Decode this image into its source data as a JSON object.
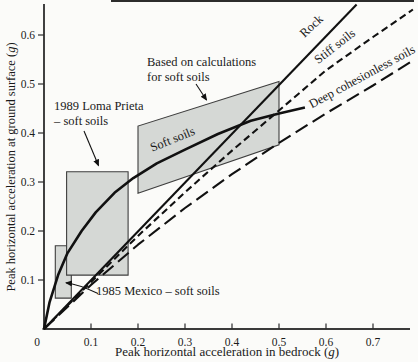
{
  "figure": {
    "background": "#fbfbf9",
    "ink": "#111111",
    "box_fill": "#d5d8d5",
    "box_stroke": "#3e3e3e"
  },
  "axes": {
    "xlabel_pre": "Peak horizontal acceleration in bedrock (",
    "xlabel_g": "g",
    "xlabel_post": ")",
    "ylabel_pre": "Peak horizontal acceleration at ground surface (",
    "ylabel_g": "g",
    "ylabel_post": ")"
  },
  "annotations": {
    "rock": "Rock",
    "stiff": "Stiff soils",
    "deep": "Deep cohesionless soils",
    "soft": "Soft soils",
    "calc_line1": "Based on calculations",
    "calc_line2": "for soft soils",
    "loma_line1": "1989 Loma Prieta",
    "loma_line2": "– soft soils",
    "mexico": "1985 Mexico – soft soils"
  },
  "chart_data": {
    "type": "line",
    "title": "",
    "xlabel": "Peak horizontal acceleration in bedrock (g)",
    "ylabel": "Peak horizontal acceleration at ground surface (g)",
    "xlim": [
      0,
      0.78
    ],
    "ylim": [
      0,
      0.665
    ],
    "x_ticks": [
      0,
      0.1,
      0.2,
      0.3,
      0.4,
      0.5,
      0.6,
      0.7
    ],
    "y_ticks": [
      0.1,
      0.2,
      0.3,
      0.4,
      0.5,
      0.6
    ],
    "grid": false,
    "legend_position": "labels-on-lines",
    "series": [
      {
        "name": "Rock",
        "style": "solid",
        "width": 2.1,
        "dash": "",
        "points": [
          [
            0,
            0
          ],
          [
            0.665,
            0.662
          ]
        ]
      },
      {
        "name": "Stiff soils",
        "style": "dashed",
        "width": 2.1,
        "dash": "7,4",
        "points": [
          [
            0,
            0
          ],
          [
            0.1,
            0.096
          ],
          [
            0.2,
            0.19
          ],
          [
            0.3,
            0.279
          ],
          [
            0.4,
            0.364
          ],
          [
            0.5,
            0.446
          ],
          [
            0.6,
            0.528
          ],
          [
            0.7,
            0.596
          ],
          [
            0.785,
            0.652
          ]
        ]
      },
      {
        "name": "Deep cohesionless soils",
        "style": "dashed",
        "width": 2.1,
        "dash": "14,6",
        "points": [
          [
            0,
            0
          ],
          [
            0.1,
            0.09
          ],
          [
            0.2,
            0.172
          ],
          [
            0.3,
            0.247
          ],
          [
            0.4,
            0.316
          ],
          [
            0.5,
            0.38
          ],
          [
            0.6,
            0.44
          ],
          [
            0.7,
            0.497
          ],
          [
            0.785,
            0.548
          ]
        ]
      },
      {
        "name": "Soft soils",
        "style": "solid",
        "width": 2.6,
        "dash": "",
        "points": [
          [
            0,
            0
          ],
          [
            0.012,
            0.055
          ],
          [
            0.03,
            0.11
          ],
          [
            0.05,
            0.155
          ],
          [
            0.08,
            0.2
          ],
          [
            0.11,
            0.238
          ],
          [
            0.15,
            0.278
          ],
          [
            0.19,
            0.308
          ],
          [
            0.24,
            0.338
          ],
          [
            0.3,
            0.366
          ],
          [
            0.37,
            0.398
          ],
          [
            0.44,
            0.425
          ],
          [
            0.5,
            0.44
          ],
          [
            0.555,
            0.452
          ]
        ]
      }
    ],
    "regions": [
      {
        "name": "1985 Mexico – soft soils box",
        "points": [
          [
            0.024,
            0.063
          ],
          [
            0.058,
            0.063
          ],
          [
            0.058,
            0.17
          ],
          [
            0.024,
            0.17
          ]
        ]
      },
      {
        "name": "1989 Loma Prieta – soft soils box",
        "points": [
          [
            0.048,
            0.11
          ],
          [
            0.179,
            0.11
          ],
          [
            0.179,
            0.321
          ],
          [
            0.048,
            0.321
          ]
        ]
      },
      {
        "name": "Based on calculations for soft soils band",
        "points": [
          [
            0.2,
            0.277
          ],
          [
            0.5,
            0.376
          ],
          [
            0.5,
            0.505
          ],
          [
            0.2,
            0.414
          ]
        ]
      }
    ]
  }
}
